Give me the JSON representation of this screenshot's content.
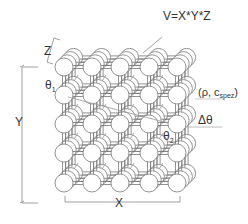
{
  "diagram": {
    "type": "lattice-of-spheres",
    "labels": {
      "volume": "V=X*Y*Z",
      "z_dim": "Z",
      "y_dim": "Y",
      "x_dim": "X",
      "theta1": "θ",
      "theta1_sub": "1",
      "theta2": "θ",
      "theta2_sub": "2",
      "rho_c": "(ρ, c",
      "rho_c_sub": "spez",
      "rho_c_close": ")",
      "delta_theta": "Δθ"
    },
    "grid": {
      "columns": 5,
      "rows": 5,
      "depth_layers": 4
    },
    "colors": {
      "line": "#777777",
      "sphere_fill": "#ffffff",
      "text": "#333333"
    }
  }
}
